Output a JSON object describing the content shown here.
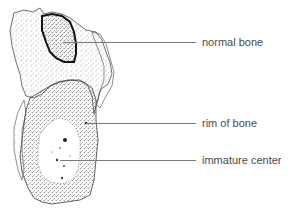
{
  "figure": {
    "colors": {
      "stipple": "#1a1a1a",
      "outline": "#222222",
      "leader": "#7a7a7a",
      "label_text": "#4a4a4a",
      "background": "#ffffff"
    }
  },
  "labels": [
    {
      "id": "normal-bone",
      "text": "normal bone",
      "line_y": 42,
      "line_x1": 63,
      "line_x2": 196,
      "text_x": 202
    },
    {
      "id": "rim-of-bone",
      "text": "rim of bone",
      "line_y": 123,
      "line_x1": 86,
      "line_x2": 196,
      "text_x": 202
    },
    {
      "id": "immature-center",
      "text": "immature center",
      "line_y": 160,
      "line_x1": 60,
      "line_x2": 196,
      "text_x": 202
    }
  ]
}
